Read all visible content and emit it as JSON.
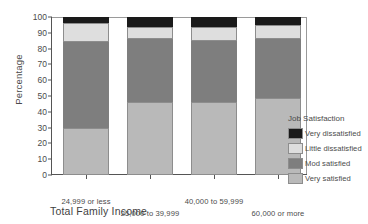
{
  "chart_data": {
    "type": "bar",
    "subtype": "stacked-bar-100",
    "title": "",
    "xlabel": "Total Family Income",
    "ylabel": "Percentage",
    "ylim": [
      0,
      100
    ],
    "yticks": [
      0,
      10,
      20,
      30,
      40,
      50,
      60,
      70,
      80,
      90,
      100
    ],
    "grid": false,
    "legend_position": "right",
    "legend_title": "Job Satisfaction",
    "categories": [
      "24,999 or less",
      "25,000 to 39,999",
      "40,000 to 59,999",
      "60,000 or more"
    ],
    "series": [
      {
        "name": "Very satisfied",
        "color": "#b9b9b9",
        "values": [
          30,
          46,
          46,
          49
        ]
      },
      {
        "name": "Mod satisfied",
        "color": "#7e7e7e",
        "values": [
          54,
          40,
          39,
          37
        ]
      },
      {
        "name": "Little dissatisfied",
        "color": "#dedede",
        "values": [
          12,
          8,
          9,
          9
        ]
      },
      {
        "name": "Very dissatisfied",
        "color": "#1a1a1a",
        "values": [
          4,
          6,
          6,
          5
        ]
      }
    ],
    "legend_entries": [
      {
        "label": "Very dissatisfied",
        "color": "#1a1a1a"
      },
      {
        "label": "Little dissatisfied",
        "color": "#dedede"
      },
      {
        "label": "Mod satisfied",
        "color": "#7e7e7e"
      },
      {
        "label": "Very satisfied",
        "color": "#b9b9b9"
      }
    ]
  }
}
